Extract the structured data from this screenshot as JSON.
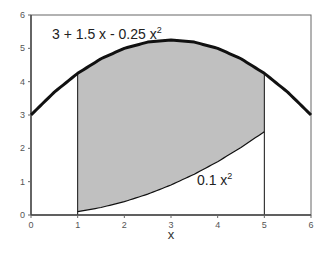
{
  "chart_data": {
    "type": "area",
    "title": "",
    "xlabel": "x",
    "ylabel": "",
    "xlim": [
      0,
      6
    ],
    "ylim": [
      0,
      6
    ],
    "grid": false,
    "legend": null,
    "x_ticks": [
      "0",
      "1",
      "2",
      "3",
      "4",
      "5",
      "6"
    ],
    "y_ticks": [
      "0",
      "1",
      "2",
      "3",
      "4",
      "5",
      "6"
    ],
    "series": [
      {
        "name": "3 + 1.5 x - 0.25 x^2",
        "label_base": "3 + 1.5 x - 0.25 x",
        "label_sup": "2",
        "style": "thick black line",
        "x": [
          0,
          0.5,
          1,
          1.5,
          2,
          2.5,
          3,
          3.5,
          4,
          4.5,
          5,
          5.5,
          6
        ],
        "values": [
          3.0,
          3.6875,
          4.25,
          4.6875,
          5.0,
          5.1875,
          5.25,
          5.1875,
          5.0,
          4.6875,
          4.25,
          3.6875,
          3.0
        ]
      },
      {
        "name": "0.1 x^2",
        "label_base": "0.1 x",
        "label_sup": "2",
        "style": "thin black line",
        "x": [
          1,
          1.5,
          2,
          2.5,
          3,
          3.5,
          4,
          4.5,
          5
        ],
        "values": [
          0.1,
          0.225,
          0.4,
          0.625,
          0.9,
          1.225,
          1.6,
          2.025,
          2.5
        ]
      }
    ],
    "shaded_region": {
      "between": [
        "3 + 1.5 x - 0.25 x^2",
        "0.1 x^2"
      ],
      "x_from": 1,
      "x_to": 5,
      "color": "#c0c0c0"
    },
    "vertical_lines": [
      1,
      5
    ],
    "colors": {
      "fill": "#c0c0c0",
      "line": "#111111",
      "frame": "#666666",
      "ticks": "#555555"
    }
  }
}
